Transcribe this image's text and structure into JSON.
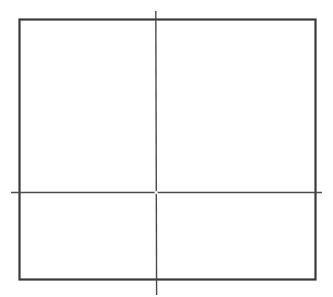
{
  "diagram": {
    "background": "#ffffff",
    "rectangle": {
      "x": 19.5,
      "y": 19.5,
      "width": 296,
      "height": 260,
      "stroke": "#3a3a3a",
      "stroke_width": 2.2
    },
    "horizontal_line": {
      "x1": 11,
      "y1": 192.5,
      "x2": 322,
      "y2": 192.5,
      "stroke": "#4a4a4a",
      "stroke_width": 1.6
    },
    "vertical_line": {
      "x1": 155.8,
      "y1": 11,
      "x2": 156.6,
      "y2": 295,
      "stroke": "#4a4a4a",
      "stroke_width": 1.4
    },
    "intersection_point": {
      "cx": 156.2,
      "cy": 192.5,
      "r": 1.6,
      "fill": "#ffffff"
    }
  }
}
